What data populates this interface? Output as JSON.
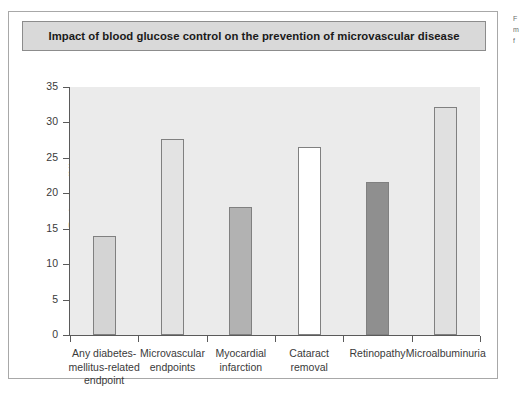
{
  "figure": {
    "title": "Impact of blood glucose control on the prevention of microvascular disease"
  },
  "margin_notes": {
    "lines": [
      "F",
      "m",
      "f"
    ]
  },
  "chart_data": {
    "type": "bar",
    "title": "Impact of blood glucose control on the prevention of microvascular disease",
    "xlabel": "",
    "ylabel": "Reduction (%)",
    "ylim": [
      0,
      35
    ],
    "ytick_step": 5,
    "grid": false,
    "legend": "none",
    "categories": [
      "Any diabetes-mellitus-related endpoint",
      "Microvascular endpoints",
      "Myocardial infarction",
      "Cataract removal",
      "Retinopathy",
      "Microalbuminuria"
    ],
    "category_lines": [
      [
        "Any diabetes-",
        "mellitus-related",
        "endpoint"
      ],
      [
        "Microvascular",
        "endpoints"
      ],
      [
        "Myocardial",
        "infarction"
      ],
      [
        "Cataract",
        "removal"
      ],
      [
        "Retinopathy"
      ],
      [
        "Microalbuminuria"
      ]
    ],
    "values": [
      14.0,
      27.7,
      18.0,
      26.5,
      21.6,
      32.2
    ],
    "bar_colors": [
      "#d4d4d4",
      "#e3e3e3",
      "#b2b2b2",
      "#ffffff",
      "#8f8f8f",
      "#e0e0e0"
    ],
    "bar_border_color": "#808080",
    "ytick_labels": [
      "0",
      "5",
      "10",
      "15",
      "20",
      "25",
      "30",
      "35"
    ],
    "ytick_values": [
      0,
      5,
      10,
      15,
      20,
      25,
      30,
      35
    ],
    "plot_background": "#ebebeb",
    "axis_color": "#5a5a5a"
  }
}
